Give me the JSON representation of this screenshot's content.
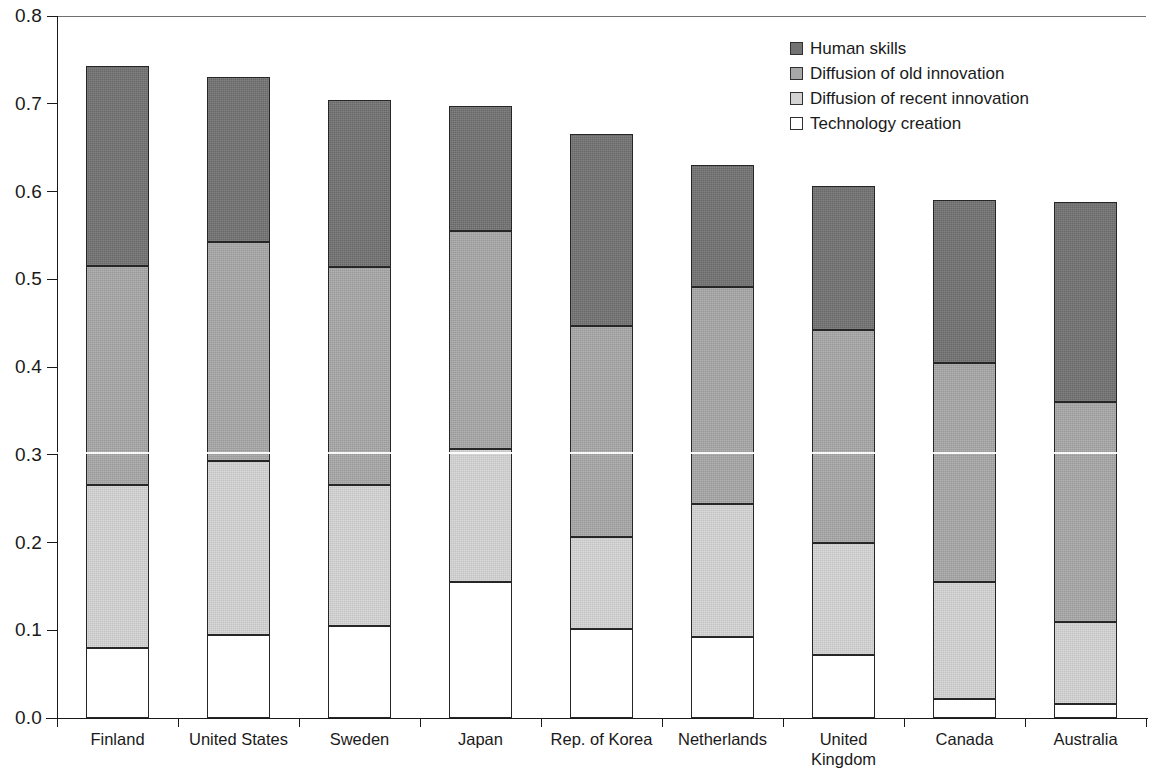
{
  "chart_data": {
    "type": "bar",
    "stacked": true,
    "title": "",
    "subtitle": "",
    "xlabel": "",
    "ylabel": "",
    "ylim": [
      0.0,
      0.8
    ],
    "ytick_labels": [
      "0.0",
      "0.1",
      "0.2",
      "0.3",
      "0.4",
      "0.5",
      "0.6",
      "0.7",
      "0.8"
    ],
    "ytick_values": [
      0.0,
      0.1,
      0.2,
      0.3,
      0.4,
      0.5,
      0.6,
      0.7,
      0.8
    ],
    "grid": false,
    "legend_position": "top-right",
    "categories": [
      "Finland",
      "United States",
      "Sweden",
      "Japan",
      "Rep. of Korea",
      "Netherlands",
      "United\nKingdom",
      "Canada",
      "Australia"
    ],
    "series": [
      {
        "name": "Technology creation",
        "color": "#ffffff",
        "values": [
          0.08,
          0.095,
          0.105,
          0.155,
          0.101,
          0.092,
          0.072,
          0.022,
          0.016
        ]
      },
      {
        "name": "Diffusion of recent innovation",
        "color": "#d3d3d3",
        "values": [
          0.185,
          0.198,
          0.161,
          0.152,
          0.105,
          0.152,
          0.127,
          0.133,
          0.093
        ]
      },
      {
        "name": "Diffusion of old innovation",
        "color": "#a8a8a8",
        "values": [
          0.25,
          0.25,
          0.248,
          0.248,
          0.241,
          0.247,
          0.243,
          0.25,
          0.251
        ]
      },
      {
        "name": "Human skills",
        "color": "#737373",
        "values": [
          0.228,
          0.188,
          0.19,
          0.143,
          0.219,
          0.139,
          0.164,
          0.185,
          0.228
        ]
      }
    ],
    "totals": [
      0.743,
      0.731,
      0.704,
      0.698,
      0.666,
      0.63,
      0.606,
      0.59,
      0.588
    ],
    "segment_tops": {
      "Finland": {
        "technology_creation": 0.08,
        "diffusion_recent": 0.265,
        "diffusion_old": 0.515,
        "human_skills": 0.743
      },
      "United States": {
        "technology_creation": 0.095,
        "diffusion_recent": 0.293,
        "diffusion_old": 0.543,
        "human_skills": 0.731
      },
      "Sweden": {
        "technology_creation": 0.105,
        "diffusion_recent": 0.266,
        "diffusion_old": 0.514,
        "human_skills": 0.704
      },
      "Japan": {
        "technology_creation": 0.155,
        "diffusion_recent": 0.307,
        "diffusion_old": 0.555,
        "human_skills": 0.698
      },
      "Rep. of Korea": {
        "technology_creation": 0.101,
        "diffusion_recent": 0.206,
        "diffusion_old": 0.447,
        "human_skills": 0.666
      },
      "Netherlands": {
        "technology_creation": 0.092,
        "diffusion_recent": 0.244,
        "diffusion_old": 0.491,
        "human_skills": 0.63
      },
      "United Kingdom": {
        "technology_creation": 0.072,
        "diffusion_recent": 0.199,
        "diffusion_old": 0.442,
        "human_skills": 0.606
      },
      "Canada": {
        "technology_creation": 0.022,
        "diffusion_recent": 0.155,
        "diffusion_old": 0.405,
        "human_skills": 0.59
      },
      "Australia": {
        "technology_creation": 0.016,
        "diffusion_recent": 0.109,
        "diffusion_old": 0.36,
        "human_skills": 0.588
      }
    }
  },
  "legend": {
    "items": [
      {
        "label": "Human skills",
        "key": "human",
        "color": "#737373"
      },
      {
        "label": "Diffusion of old innovation",
        "key": "old",
        "color": "#a8a8a8"
      },
      {
        "label": "Diffusion of recent innovation",
        "key": "recent",
        "color": "#d3d3d3"
      },
      {
        "label": "Technology creation",
        "key": "tech",
        "color": "#ffffff"
      }
    ]
  }
}
